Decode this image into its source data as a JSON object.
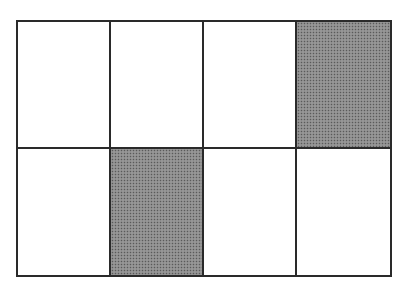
{
  "diagram": {
    "type": "fraction-grid",
    "rows": 2,
    "columns": 4,
    "total_cells": 8,
    "shaded_cells": 2,
    "fill_color": "#8a8a8a",
    "line_color": "#2a2a2a",
    "cells": [
      {
        "row": 1,
        "col": 1,
        "shaded": false
      },
      {
        "row": 1,
        "col": 2,
        "shaded": false
      },
      {
        "row": 1,
        "col": 3,
        "shaded": false
      },
      {
        "row": 1,
        "col": 4,
        "shaded": true
      },
      {
        "row": 2,
        "col": 1,
        "shaded": false
      },
      {
        "row": 2,
        "col": 2,
        "shaded": true
      },
      {
        "row": 2,
        "col": 3,
        "shaded": false
      },
      {
        "row": 2,
        "col": 4,
        "shaded": false
      }
    ]
  }
}
